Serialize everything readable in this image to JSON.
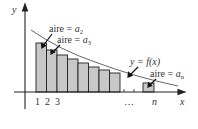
{
  "diagram": {
    "axis_labels": {
      "x": "x",
      "y": "y"
    },
    "tick_labels": [
      "1",
      "2",
      "3",
      "…",
      "n"
    ],
    "curve_label": "y = f(x)",
    "area_labels": {
      "a2": {
        "prefix": "aire = ",
        "var": "a",
        "sub": "2"
      },
      "a3": {
        "prefix": "aire = ",
        "var": "a",
        "sub": "3"
      },
      "an": {
        "prefix": "aire = ",
        "var": "a",
        "sub": "n"
      }
    },
    "colors": {
      "bar_fill": "#c8c8c8",
      "stroke": "#222222",
      "curve": "#555555",
      "text": "#333333"
    }
  }
}
